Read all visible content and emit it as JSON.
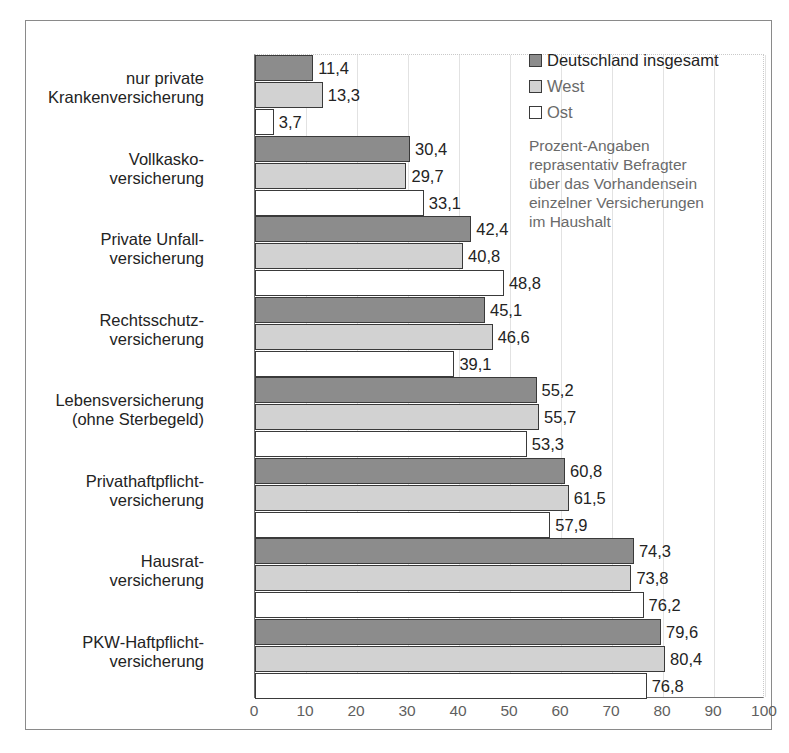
{
  "chart_data": {
    "type": "bar",
    "orientation": "horizontal",
    "title": "",
    "xlabel": "",
    "ylabel": "",
    "xlim": [
      0,
      100
    ],
    "xticks": [
      "0",
      "10",
      "20",
      "30",
      "40",
      "50",
      "60",
      "70",
      "80",
      "90",
      "100"
    ],
    "grid": true,
    "legend_position": "top-right",
    "categories": [
      "nur private\nKrankenversicherung",
      "Vollkasko-\nversicherung",
      "Private Unfall-\nversicherung",
      "Rechtsschutz-\nversicherung",
      "Lebensversicherung\n(ohne Sterbegeld)",
      "Privathaftpflicht-\nversicherung",
      "Hausrat-\nversicherung",
      "PKW-Haftpflicht-\nversicherung"
    ],
    "series": [
      {
        "name": "Deutschland insgesamt",
        "color": "#8c8c8c",
        "values": [
          11.4,
          30.4,
          42.4,
          45.1,
          55.2,
          60.8,
          74.3,
          79.6
        ],
        "labels": [
          "11,4",
          "30,4",
          "42,4",
          "45,1",
          "55,2",
          "60,8",
          "74,3",
          "79,6"
        ]
      },
      {
        "name": "West",
        "color": "#d2d2d2",
        "values": [
          13.3,
          29.7,
          40.8,
          46.6,
          55.7,
          61.5,
          73.8,
          80.4
        ],
        "labels": [
          "13,3",
          "29,7",
          "40,8",
          "46,6",
          "55,7",
          "61,5",
          "73,8",
          "80,4"
        ]
      },
      {
        "name": "Ost",
        "color": "#ffffff",
        "values": [
          3.7,
          33.1,
          48.8,
          39.1,
          53.3,
          57.9,
          76.2,
          76.8
        ],
        "labels": [
          "3,7",
          "33,1",
          "48,8",
          "39,1",
          "53,3",
          "57,9",
          "76,2",
          "76,8"
        ]
      }
    ],
    "annotation": "Prozent-Angaben\nreprasentativ Befragter\nüber das Vorhandensein\neinzelner Versicherungen\nim Haushalt"
  },
  "legend": {
    "items": [
      {
        "label": "Deutschland insgesamt",
        "swatch": "s0"
      },
      {
        "label": "West",
        "swatch": "s1"
      },
      {
        "label": "Ost",
        "swatch": "s2"
      }
    ],
    "note": "Prozent-Angaben\nreprasentativ Befragter\nüber das Vorhandensein\neinzelner Versicherungen\nim Haushalt"
  }
}
